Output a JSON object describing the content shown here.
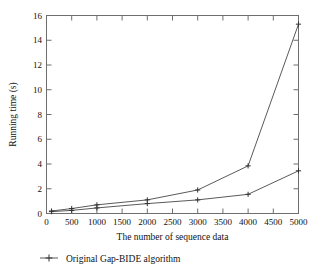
{
  "chart_data": {
    "type": "line",
    "title": "",
    "xlabel": "The number of sequence data",
    "ylabel": "Running time (s)",
    "xlim": [
      0,
      5000
    ],
    "ylim": [
      0,
      16
    ],
    "xticks": [
      0,
      500,
      1000,
      1500,
      2000,
      2500,
      3000,
      3500,
      4000,
      4500,
      5000
    ],
    "xtick_labels": [
      "0",
      "500",
      "1000",
      "1500",
      "2000",
      "2500",
      "3000",
      "3500",
      "4000",
      "4500",
      "5000"
    ],
    "yticks": [
      0,
      2,
      4,
      6,
      8,
      10,
      12,
      14,
      16
    ],
    "ytick_labels": [
      "0",
      "2",
      "4",
      "6",
      "8",
      "10",
      "12",
      "14",
      "16"
    ],
    "grid": false,
    "legend_position": "below-left",
    "x": [
      100,
      500,
      1000,
      2000,
      3000,
      4000,
      5000
    ],
    "series": [
      {
        "name": "Original Gap-BIDE algorithm",
        "marker": "plus",
        "values": [
          0.2,
          0.4,
          0.7,
          1.1,
          1.9,
          3.85,
          15.3
        ]
      },
      {
        "name": "",
        "marker": "plus",
        "values": [
          0.15,
          0.25,
          0.45,
          0.8,
          1.1,
          1.55,
          3.45
        ]
      }
    ]
  },
  "legend": {
    "entries": [
      {
        "label": "Original Gap-BIDE algorithm",
        "marker": "plus-line-marker"
      }
    ]
  },
  "colors": {
    "line": "#5a5a5a",
    "axis": "#6e6e6e",
    "text": "#111111",
    "background": "#ffffff"
  }
}
